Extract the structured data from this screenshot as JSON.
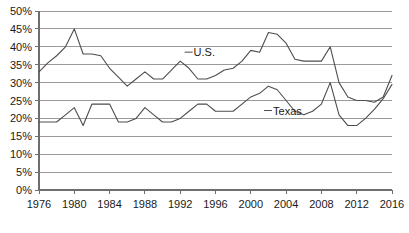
{
  "chart_data": {
    "type": "line",
    "title": "",
    "subtitle": "",
    "xlabel": "",
    "ylabel": "",
    "xlim": [
      1976,
      2016
    ],
    "ylim": [
      0,
      50
    ],
    "grid": true,
    "legend_position": "inline-annotation",
    "y_ticks": [
      "0%",
      "5%",
      "10%",
      "15%",
      "20%",
      "25%",
      "30%",
      "35%",
      "40%",
      "45%",
      "50%"
    ],
    "y_tick_values": [
      0,
      5,
      10,
      15,
      20,
      25,
      30,
      35,
      40,
      45,
      50
    ],
    "x_ticks": [
      "1976",
      "1980",
      "1984",
      "1988",
      "1992",
      "1996",
      "2000",
      "2004",
      "2008",
      "2012",
      "2016"
    ],
    "x_tick_values": [
      1976,
      1980,
      1984,
      1988,
      1992,
      1996,
      2000,
      2004,
      2008,
      2012,
      2016
    ],
    "x": [
      1976,
      1977,
      1978,
      1979,
      1980,
      1981,
      1982,
      1983,
      1984,
      1985,
      1986,
      1987,
      1988,
      1989,
      1990,
      1991,
      1992,
      1993,
      1994,
      1995,
      1996,
      1997,
      1998,
      1999,
      2000,
      2001,
      2002,
      2003,
      2004,
      2005,
      2006,
      2007,
      2008,
      2009,
      2010,
      2011,
      2012,
      2013,
      2014,
      2015,
      2016
    ],
    "series": [
      {
        "name": "U.S.",
        "label": "U.S.",
        "color": "#4d4d4d",
        "values": [
          33,
          35.5,
          37.5,
          40,
          45,
          38,
          38,
          37.5,
          34,
          31.5,
          29,
          31,
          33,
          31,
          31,
          33.5,
          36,
          34,
          31,
          31,
          32,
          33.5,
          34,
          36,
          39,
          38.5,
          44,
          43.5,
          41,
          36.5,
          36,
          36,
          36,
          40,
          30,
          26,
          25,
          25,
          24.5,
          26,
          32
        ]
      },
      {
        "name": "Texas",
        "label": "Texas",
        "color": "#7a7a7a",
        "values": [
          19,
          19,
          19,
          21,
          23,
          18,
          24,
          24,
          24,
          19,
          19,
          20,
          23,
          21,
          19,
          19,
          20,
          22,
          24,
          24,
          22,
          22,
          22,
          24,
          26,
          27,
          29,
          28,
          25,
          22,
          21,
          22,
          24,
          30,
          21,
          18,
          18,
          20,
          22.5,
          25.5,
          29.5
        ]
      }
    ],
    "annotations": [
      {
        "text": "U.S.",
        "x_value": 1992.5,
        "y_value": 38.5
      },
      {
        "text": "Texas",
        "x_value": 2001.5,
        "y_value": 22.2
      }
    ]
  }
}
